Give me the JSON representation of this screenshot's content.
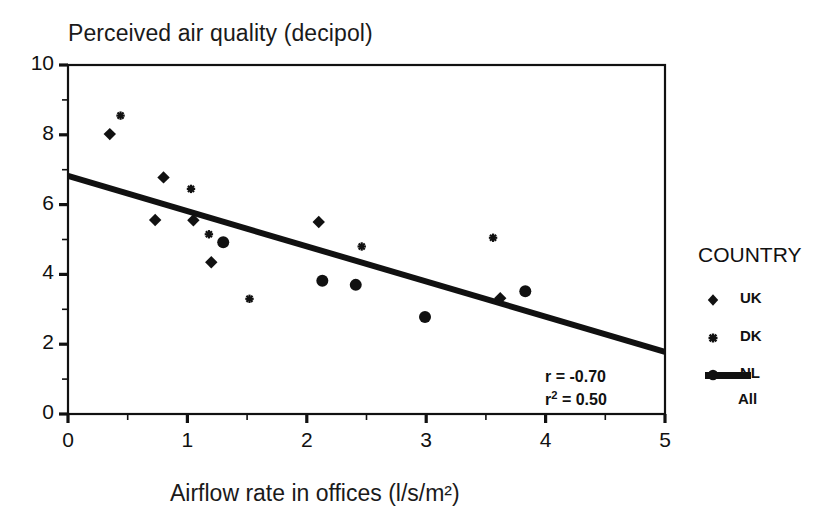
{
  "chart_data": {
    "type": "scatter",
    "title": "Perceived air quality (decipol)",
    "xlabel": "Airflow rate in offices (l/s/m²)",
    "ylabel": "Perceived air quality (decipol)",
    "xlim": [
      0,
      5
    ],
    "ylim": [
      0,
      10
    ],
    "xticks": [
      "0",
      "1",
      "2",
      "3",
      "4",
      "5"
    ],
    "yticks": [
      "0",
      "2",
      "4",
      "6",
      "8",
      "10"
    ],
    "x_minor_ticks": [
      0.5,
      1.5,
      2.5,
      3.5,
      4.5
    ],
    "y_minor_ticks": [
      1,
      3,
      5,
      7,
      9
    ],
    "grid": false,
    "legend_position": "right",
    "legend_title": "COUNTRY",
    "series": [
      {
        "name": "UK",
        "marker": "diamond",
        "points": [
          {
            "x": 0.35,
            "y": 8.02
          },
          {
            "x": 0.8,
            "y": 6.78
          },
          {
            "x": 0.73,
            "y": 5.56
          },
          {
            "x": 1.05,
            "y": 5.55
          },
          {
            "x": 1.2,
            "y": 4.35
          },
          {
            "x": 2.1,
            "y": 5.5
          },
          {
            "x": 3.62,
            "y": 3.32
          }
        ]
      },
      {
        "name": "DK",
        "marker": "asterisk",
        "points": [
          {
            "x": 0.44,
            "y": 8.55
          },
          {
            "x": 1.03,
            "y": 6.45
          },
          {
            "x": 1.18,
            "y": 5.15
          },
          {
            "x": 1.52,
            "y": 3.3
          },
          {
            "x": 2.46,
            "y": 4.8
          },
          {
            "x": 3.56,
            "y": 5.05
          }
        ]
      },
      {
        "name": "NL",
        "marker": "circle",
        "points": [
          {
            "x": 1.3,
            "y": 4.92
          },
          {
            "x": 2.13,
            "y": 3.82
          },
          {
            "x": 2.41,
            "y": 3.7
          },
          {
            "x": 2.99,
            "y": 2.78
          },
          {
            "x": 3.83,
            "y": 3.52
          }
        ]
      }
    ],
    "fit_line": {
      "name": "All",
      "marker": "line",
      "x_start": 0,
      "y_start": 6.82,
      "x_end": 5,
      "y_end": 1.78
    },
    "annotations": {
      "r_label": "r = -0.70",
      "r2_label_prefix": "r",
      "r2_label_sup": "2",
      "r2_label_suffix": " = 0.50",
      "r_value": -0.7,
      "r2_value": 0.5
    },
    "colors": {
      "axis": "#111111",
      "marker": "#111111",
      "fit_line": "#111111",
      "background": "#ffffff"
    }
  },
  "legend": {
    "title": "COUNTRY",
    "entries": [
      {
        "label": "UK",
        "marker": "diamond-marker-icon"
      },
      {
        "label": "DK",
        "marker": "asterisk-marker-icon"
      },
      {
        "label": "NL",
        "marker": "circle-marker-icon"
      },
      {
        "label": "All",
        "marker": "line-swatch-icon"
      }
    ]
  },
  "axes": {
    "y_tick_labels": [
      "10",
      "8",
      "6",
      "4",
      "2",
      "0"
    ],
    "x_tick_labels": [
      "0",
      "1",
      "2",
      "3",
      "4",
      "5"
    ]
  }
}
